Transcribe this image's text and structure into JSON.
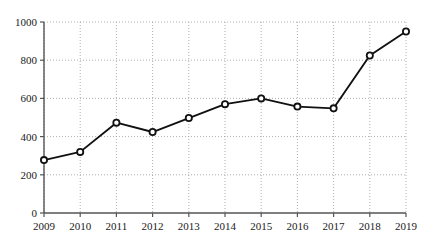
{
  "chart_data": {
    "type": "line",
    "title": "",
    "subtitle": "",
    "xlabel": "",
    "ylabel": "",
    "categories": [
      "2009",
      "2010",
      "2011",
      "2012",
      "2013",
      "2014",
      "2015",
      "2016",
      "2017",
      "2018",
      "2019"
    ],
    "x": [
      2009,
      2010,
      2011,
      2012,
      2013,
      2014,
      2015,
      2016,
      2017,
      2018,
      2019
    ],
    "values": [
      277,
      320,
      473,
      424,
      497,
      570,
      600,
      557,
      548,
      825,
      950
    ],
    "series": [
      {
        "name": "",
        "values": [
          277,
          320,
          473,
          424,
          497,
          570,
          600,
          557,
          548,
          825,
          950
        ]
      }
    ],
    "xlim": [
      2009,
      2019
    ],
    "ylim": [
      0,
      1000
    ],
    "yticks": [
      0,
      200,
      400,
      600,
      800,
      1000
    ],
    "ytick_labels": [
      "0",
      "200",
      "400",
      "600",
      "800",
      "1000"
    ],
    "xtick_labels": [
      "2009",
      "2010",
      "2011",
      "2012",
      "2013",
      "2014",
      "2015",
      "2016",
      "2017",
      "2018",
      "2019"
    ],
    "grid": true,
    "grid_style": "dotted",
    "legend": false,
    "legend_position": "none",
    "marker": "circle",
    "annotations": []
  },
  "style": {
    "line_color": "#111111",
    "marker_fill": "#ffffff",
    "marker_edge": "#111111",
    "grid_color": "#9a9a9a",
    "axis_color": "#555555",
    "text_color": "#1a1a1a",
    "background": "#ffffff"
  },
  "geometry": {
    "plot_left": 44,
    "plot_right": 406,
    "plot_top": 22,
    "plot_bottom": 213
  }
}
